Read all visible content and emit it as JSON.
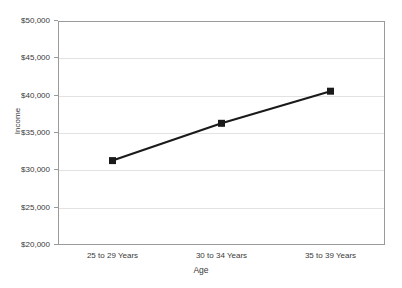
{
  "chart_data": {
    "type": "line",
    "title": "",
    "xlabel": "Age",
    "ylabel": "Income",
    "categories": [
      "25 to 29 Years",
      "30 to 34 Years",
      "35 to 39 Years"
    ],
    "values": [
      31300,
      36300,
      40600
    ],
    "series": [
      {
        "name": "Income",
        "values": [
          31300,
          36300,
          40600
        ]
      }
    ],
    "ylim": [
      20000,
      50000
    ],
    "ytick_values": [
      20000,
      25000,
      30000,
      35000,
      40000,
      45000,
      50000
    ],
    "ytick_labels": [
      "$20,000",
      "$25,000",
      "$30,000",
      "$35,000",
      "$40,000",
      "$45,000",
      "$50,000"
    ],
    "grid": true,
    "grid_axis": "y",
    "legend": false,
    "legend_position": "none",
    "marker": "square",
    "line_color": "#1a1a1a",
    "marker_color": "#1a1a1a",
    "grid_color": "#e2e2e2",
    "axis_color": "#9a9a9a",
    "background_color": "#ffffff",
    "text_color": "#3a3a3a"
  }
}
